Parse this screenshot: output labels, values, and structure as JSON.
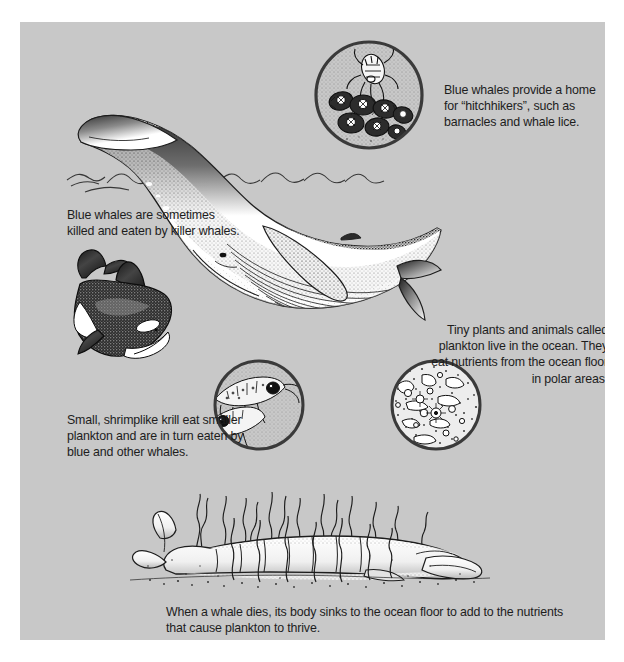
{
  "page": {
    "background_color": "#ffffff",
    "panel_color": "#c8c8c8",
    "ink_color": "#1d1d1d",
    "width": 624,
    "height": 662
  },
  "captions": {
    "hitchhikers": "Blue whales provide a home for “hitchhikers”, such as barnacles and whale lice.",
    "killer_whales": "Blue whales are sometimes killed and eaten by killer whales.",
    "plankton": "Tiny plants and animals called plankton live in the ocean. They eat nutrients from the ocean floor in polar areas.",
    "krill": "Small, shrimplike krill eat smaller plankton and are in turn eaten by blue and other whales.",
    "dead_whale": "When a whale dies, its body sinks to the ocean floor to add to the nutrients that cause plankton to thrive."
  },
  "illustrations": [
    {
      "name": "blue-whale",
      "label": "Blue whale breaching at the ocean surface"
    },
    {
      "name": "killer-whale",
      "label": "Killer whale (orca)"
    },
    {
      "name": "barnacle-detail-circle",
      "label": "Circular inset: whale lice and barnacles"
    },
    {
      "name": "krill-detail-circle",
      "label": "Circular inset: shrimplike krill"
    },
    {
      "name": "plankton-detail-circle",
      "label": "Circular inset: microscopic plankton"
    },
    {
      "name": "dead-whale-seafloor",
      "label": "Dead whale carcass on the ocean floor with seaweed"
    }
  ]
}
